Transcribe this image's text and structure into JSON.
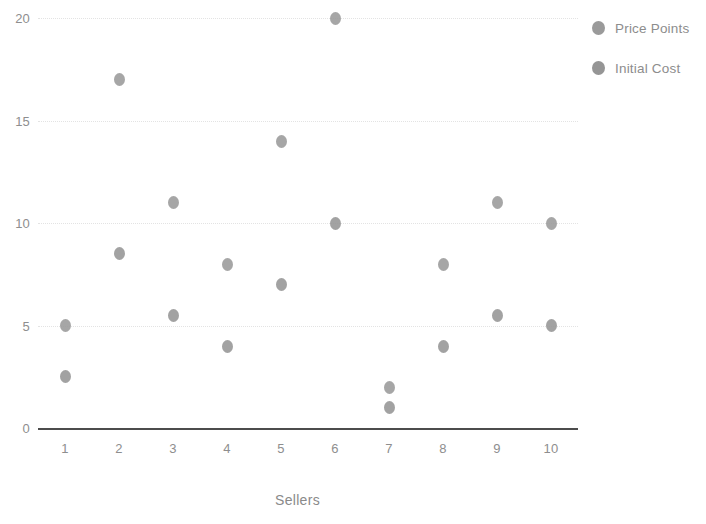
{
  "chart_data": {
    "type": "scatter",
    "title": "",
    "xlabel": "Sellers",
    "ylabel": "",
    "categories": [
      "1",
      "2",
      "3",
      "4",
      "5",
      "6",
      "7",
      "8",
      "9",
      "10"
    ],
    "x": [
      1,
      2,
      3,
      4,
      5,
      6,
      7,
      8,
      9,
      10
    ],
    "series": [
      {
        "name": "Price Points",
        "color": "#9a9a9a",
        "values": [
          5,
          17,
          11,
          8,
          14,
          20,
          2,
          8,
          11,
          10
        ]
      },
      {
        "name": "Initial Cost",
        "color": "#959595",
        "values": [
          2.5,
          8.5,
          5.5,
          4,
          7,
          10,
          1,
          4,
          5.5,
          5
        ]
      }
    ],
    "xlim": [
      0.5,
      10.5
    ],
    "ylim": [
      0,
      20
    ],
    "yticks": [
      "0",
      "5",
      "10",
      "15",
      "20"
    ],
    "ytick_values": [
      0,
      5,
      10,
      15,
      20
    ],
    "grid": true,
    "grid_style": "dotted",
    "grid_color": "#e3e3e3",
    "axis_color": "#4c4c4c",
    "tick_label_color": "#8e8e8e",
    "background": "#ffffff",
    "legend_position": "right"
  },
  "legend": {
    "items": [
      {
        "label": "Price Points",
        "marker": "circle-marker"
      },
      {
        "label": "Initial Cost",
        "marker": "circle-marker"
      }
    ]
  },
  "axes": {
    "x_title": "Sellers"
  }
}
